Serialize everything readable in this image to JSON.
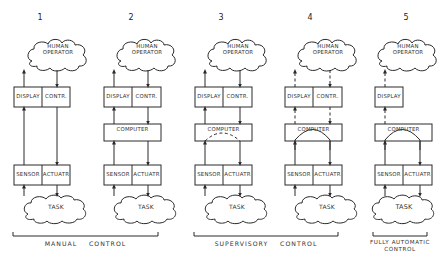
{
  "panels": [
    {
      "number": "1",
      "operator": [
        "HUMAN",
        "OPERATOR"
      ],
      "display": "DISPLAY",
      "control": "CONTR.",
      "computer": null,
      "sensor": "SENSOR",
      "actuator": "ACTUATR",
      "task": "TASK"
    },
    {
      "number": "2",
      "operator": [
        "HUMAN",
        "OPERATOR"
      ],
      "display": "DISPLAY",
      "control": "CONTR.",
      "computer": "COMPUTER",
      "sensor": "SENSOR",
      "actuator": "ACTUATR",
      "task": "TASK"
    },
    {
      "number": "3",
      "operator": [
        "HUMAN",
        "OPERATOR"
      ],
      "display": "DISPLAY",
      "control": "CONTR.",
      "computer": "COMPUTER",
      "sensor": "SENSOR",
      "actuator": "ACTUATR",
      "task": "TASK"
    },
    {
      "number": "4",
      "operator": [
        "HUMAN",
        "OPERATOR"
      ],
      "display": "DISPLAY",
      "control": "CONTR.",
      "computer": "COMPUTER",
      "sensor": "SENSOR",
      "actuator": "ACTUATR",
      "task": "TASK"
    },
    {
      "number": "5",
      "operator": [
        "HUMAN",
        "OPERATOR"
      ],
      "display": "DISPLAY",
      "control": null,
      "computer": "COMPUTER",
      "sensor": "SENSOR",
      "actuator": "ACTUATR",
      "task": "TASK"
    }
  ],
  "groups": {
    "manual": "MANUAL    CONTROL",
    "supervisory": "SUPERVISORY    CONTROL",
    "automatic_line1": "FULLY AUTOMATIC",
    "automatic_line2": "CONTROL"
  }
}
